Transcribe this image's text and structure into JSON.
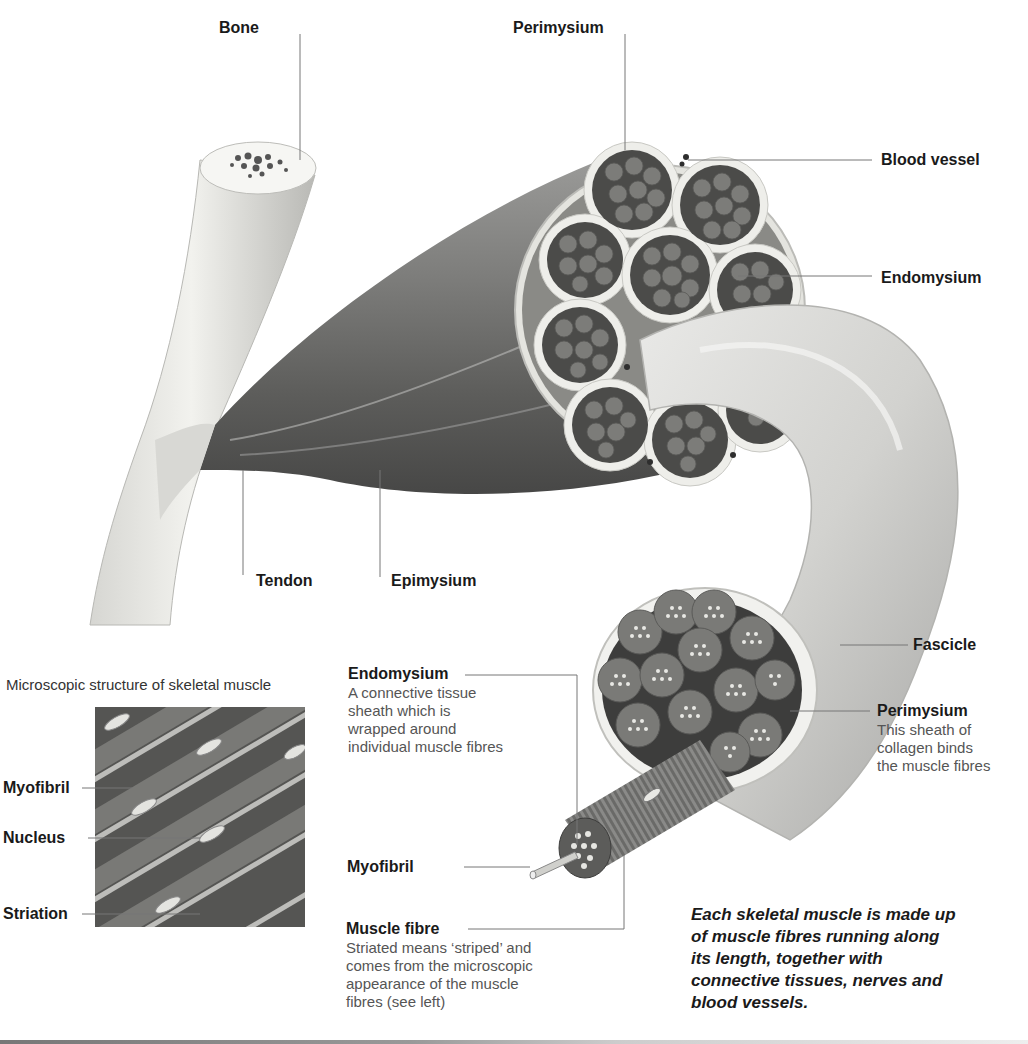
{
  "diagram": {
    "title": "Structure of skeletal muscle",
    "main_labels": {
      "bone": "Bone",
      "perimysium_top": "Perimysium",
      "blood_vessel": "Blood vessel",
      "endomysium_right": "Endomysium",
      "tendon": "Tendon",
      "epimysium": "Epimysium",
      "fascicle": "Fascicle"
    },
    "detail_labels": {
      "endomysium": {
        "label": "Endomysium",
        "description_lines": [
          "A connective tissue",
          "sheath which is",
          "wrapped around",
          "individual muscle fibres"
        ]
      },
      "perimysium": {
        "label": "Perimysium",
        "description_lines": [
          "This sheath of",
          "collagen binds",
          "the muscle fibres"
        ]
      },
      "myofibril": {
        "label": "Myofibril"
      },
      "muscle_fibre": {
        "label": "Muscle fibre",
        "description_lines": [
          "Striated means ‘striped’ and",
          "comes from the microscopic",
          "appearance of the muscle",
          "fibres (see left)"
        ]
      }
    },
    "microscopic_inset": {
      "title": "Microscopic structure of skeletal muscle",
      "labels": [
        "Myofibril",
        "Nucleus",
        "Striation"
      ]
    },
    "summary_lines": [
      "Each skeletal muscle is made up",
      "of muscle fibres running along",
      "its length, together with",
      "connective tissues, nerves and",
      "blood vessels."
    ],
    "colors": {
      "text": "#1a1a1a",
      "description_text": "#555555",
      "leader_line": "#777777",
      "fibre_fill": "#6f6f6f",
      "sheath_fill": "#eeeeea",
      "tissue_shadow": "#3c3c3c"
    }
  }
}
